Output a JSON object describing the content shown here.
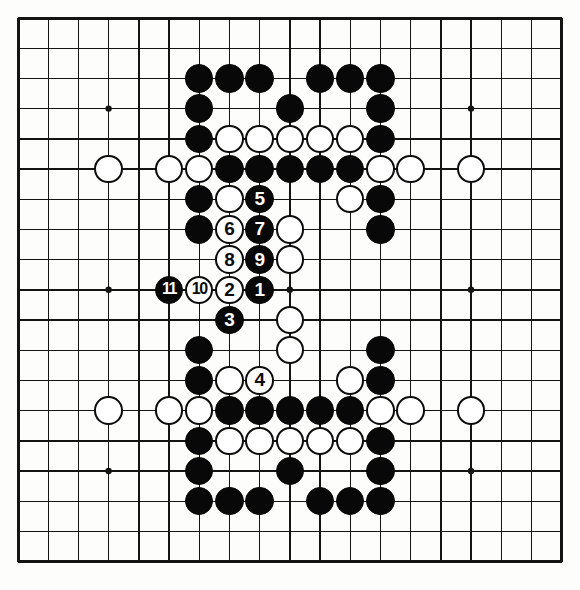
{
  "diagram": {
    "kind": "go-board-diagram",
    "board_size": 19,
    "visible_region": {
      "columns": 19,
      "rows": 19
    },
    "colors": {
      "background": "#fdfdfb",
      "line": "#141414",
      "black_stone": "#080808",
      "white_stone": "#ffffff",
      "white_stone_outline": "#0c0c0c"
    },
    "geometry": {
      "origin_x": 18,
      "origin_y": 18,
      "spacing": 30.2,
      "stone_radius": 14.2,
      "border_width": 3
    },
    "star_points": [
      {
        "col": 3,
        "row": 3
      },
      {
        "col": 9,
        "row": 3
      },
      {
        "col": 15,
        "row": 3
      },
      {
        "col": 3,
        "row": 9
      },
      {
        "col": 9,
        "row": 9
      },
      {
        "col": 15,
        "row": 9
      },
      {
        "col": 3,
        "row": 15
      },
      {
        "col": 9,
        "row": 15
      },
      {
        "col": 15,
        "row": 15
      }
    ],
    "stones": [
      {
        "col": 6,
        "row": 2,
        "color": "black",
        "label": ""
      },
      {
        "col": 7,
        "row": 2,
        "color": "black",
        "label": ""
      },
      {
        "col": 8,
        "row": 2,
        "color": "black",
        "label": ""
      },
      {
        "col": 10,
        "row": 2,
        "color": "black",
        "label": ""
      },
      {
        "col": 11,
        "row": 2,
        "color": "black",
        "label": ""
      },
      {
        "col": 12,
        "row": 2,
        "color": "black",
        "label": ""
      },
      {
        "col": 6,
        "row": 3,
        "color": "black",
        "label": ""
      },
      {
        "col": 9,
        "row": 3,
        "color": "black",
        "label": ""
      },
      {
        "col": 12,
        "row": 3,
        "color": "black",
        "label": ""
      },
      {
        "col": 6,
        "row": 4,
        "color": "black",
        "label": ""
      },
      {
        "col": 7,
        "row": 4,
        "color": "white",
        "label": ""
      },
      {
        "col": 8,
        "row": 4,
        "color": "white",
        "label": ""
      },
      {
        "col": 9,
        "row": 4,
        "color": "white",
        "label": ""
      },
      {
        "col": 10,
        "row": 4,
        "color": "white",
        "label": ""
      },
      {
        "col": 11,
        "row": 4,
        "color": "white",
        "label": ""
      },
      {
        "col": 12,
        "row": 4,
        "color": "black",
        "label": ""
      },
      {
        "col": 3,
        "row": 5,
        "color": "white",
        "label": ""
      },
      {
        "col": 5,
        "row": 5,
        "color": "white",
        "label": ""
      },
      {
        "col": 6,
        "row": 5,
        "color": "white",
        "label": ""
      },
      {
        "col": 7,
        "row": 5,
        "color": "black",
        "label": ""
      },
      {
        "col": 8,
        "row": 5,
        "color": "black",
        "label": ""
      },
      {
        "col": 9,
        "row": 5,
        "color": "black",
        "label": ""
      },
      {
        "col": 10,
        "row": 5,
        "color": "black",
        "label": ""
      },
      {
        "col": 11,
        "row": 5,
        "color": "black",
        "label": ""
      },
      {
        "col": 12,
        "row": 5,
        "color": "white",
        "label": ""
      },
      {
        "col": 13,
        "row": 5,
        "color": "white",
        "label": ""
      },
      {
        "col": 15,
        "row": 5,
        "color": "white",
        "label": ""
      },
      {
        "col": 6,
        "row": 6,
        "color": "black",
        "label": ""
      },
      {
        "col": 7,
        "row": 6,
        "color": "white",
        "label": ""
      },
      {
        "col": 8,
        "row": 6,
        "color": "black",
        "label": "5"
      },
      {
        "col": 11,
        "row": 6,
        "color": "white",
        "label": ""
      },
      {
        "col": 12,
        "row": 6,
        "color": "black",
        "label": ""
      },
      {
        "col": 6,
        "row": 7,
        "color": "black",
        "label": ""
      },
      {
        "col": 7,
        "row": 7,
        "color": "white",
        "label": "6"
      },
      {
        "col": 8,
        "row": 7,
        "color": "black",
        "label": "7"
      },
      {
        "col": 9,
        "row": 7,
        "color": "white",
        "label": ""
      },
      {
        "col": 12,
        "row": 7,
        "color": "black",
        "label": ""
      },
      {
        "col": 7,
        "row": 8,
        "color": "white",
        "label": "8"
      },
      {
        "col": 8,
        "row": 8,
        "color": "black",
        "label": "9"
      },
      {
        "col": 9,
        "row": 8,
        "color": "white",
        "label": ""
      },
      {
        "col": 5,
        "row": 9,
        "color": "black",
        "label": "11"
      },
      {
        "col": 6,
        "row": 9,
        "color": "white",
        "label": "10"
      },
      {
        "col": 7,
        "row": 9,
        "color": "white",
        "label": "2"
      },
      {
        "col": 8,
        "row": 9,
        "color": "black",
        "label": "1"
      },
      {
        "col": 7,
        "row": 10,
        "color": "black",
        "label": "3"
      },
      {
        "col": 9,
        "row": 10,
        "color": "white",
        "label": ""
      },
      {
        "col": 6,
        "row": 11,
        "color": "black",
        "label": ""
      },
      {
        "col": 9,
        "row": 11,
        "color": "white",
        "label": ""
      },
      {
        "col": 12,
        "row": 11,
        "color": "black",
        "label": ""
      },
      {
        "col": 6,
        "row": 12,
        "color": "black",
        "label": ""
      },
      {
        "col": 7,
        "row": 12,
        "color": "white",
        "label": ""
      },
      {
        "col": 8,
        "row": 12,
        "color": "white",
        "label": "4"
      },
      {
        "col": 11,
        "row": 12,
        "color": "white",
        "label": ""
      },
      {
        "col": 12,
        "row": 12,
        "color": "black",
        "label": ""
      },
      {
        "col": 3,
        "row": 13,
        "color": "white",
        "label": ""
      },
      {
        "col": 5,
        "row": 13,
        "color": "white",
        "label": ""
      },
      {
        "col": 6,
        "row": 13,
        "color": "white",
        "label": ""
      },
      {
        "col": 7,
        "row": 13,
        "color": "black",
        "label": ""
      },
      {
        "col": 8,
        "row": 13,
        "color": "black",
        "label": ""
      },
      {
        "col": 9,
        "row": 13,
        "color": "black",
        "label": ""
      },
      {
        "col": 10,
        "row": 13,
        "color": "black",
        "label": ""
      },
      {
        "col": 11,
        "row": 13,
        "color": "black",
        "label": ""
      },
      {
        "col": 12,
        "row": 13,
        "color": "white",
        "label": ""
      },
      {
        "col": 13,
        "row": 13,
        "color": "white",
        "label": ""
      },
      {
        "col": 15,
        "row": 13,
        "color": "white",
        "label": ""
      },
      {
        "col": 6,
        "row": 14,
        "color": "black",
        "label": ""
      },
      {
        "col": 7,
        "row": 14,
        "color": "white",
        "label": ""
      },
      {
        "col": 8,
        "row": 14,
        "color": "white",
        "label": ""
      },
      {
        "col": 9,
        "row": 14,
        "color": "white",
        "label": ""
      },
      {
        "col": 10,
        "row": 14,
        "color": "white",
        "label": ""
      },
      {
        "col": 11,
        "row": 14,
        "color": "white",
        "label": ""
      },
      {
        "col": 12,
        "row": 14,
        "color": "black",
        "label": ""
      },
      {
        "col": 6,
        "row": 15,
        "color": "black",
        "label": ""
      },
      {
        "col": 9,
        "row": 15,
        "color": "black",
        "label": ""
      },
      {
        "col": 12,
        "row": 15,
        "color": "black",
        "label": ""
      },
      {
        "col": 6,
        "row": 16,
        "color": "black",
        "label": ""
      },
      {
        "col": 7,
        "row": 16,
        "color": "black",
        "label": ""
      },
      {
        "col": 8,
        "row": 16,
        "color": "black",
        "label": ""
      },
      {
        "col": 10,
        "row": 16,
        "color": "black",
        "label": ""
      },
      {
        "col": 11,
        "row": 16,
        "color": "black",
        "label": ""
      },
      {
        "col": 12,
        "row": 16,
        "color": "black",
        "label": ""
      }
    ]
  }
}
